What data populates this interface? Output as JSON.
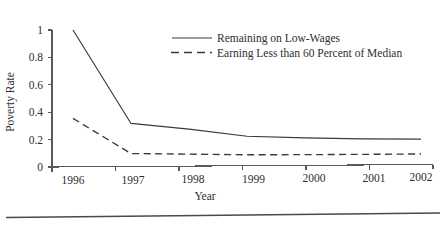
{
  "chart_data": {
    "type": "line",
    "title": "",
    "xlabel": "Year",
    "ylabel": "Poverty Rate",
    "x": [
      1996,
      1997,
      1998,
      1999,
      2000,
      2001,
      2002
    ],
    "xtick_labels": [
      "1996",
      "1997",
      "1998",
      "1999",
      "2000",
      "2001",
      "2002"
    ],
    "ytick_labels": [
      "0",
      "0.2",
      "0.4",
      "0.6",
      "0.8",
      "1"
    ],
    "yticks": [
      0,
      0.2,
      0.4,
      0.6,
      0.8,
      1
    ],
    "ylim": [
      0,
      1
    ],
    "xlim": [
      1996,
      2002
    ],
    "grid": false,
    "legend_position": "upper-center-right",
    "series": [
      {
        "name": "Remaining on Low-Wages",
        "style": "solid",
        "color": "#3a3a3a",
        "values": [
          1.0,
          0.315,
          0.27,
          0.215,
          0.2,
          0.19,
          0.185
        ]
      },
      {
        "name": "Earning Less than 60 Percent of Median",
        "style": "dashed",
        "color": "#3a3a3a",
        "values": [
          0.355,
          0.095,
          0.088,
          0.08,
          0.078,
          0.077,
          0.077
        ]
      }
    ]
  },
  "legend": {
    "items": [
      {
        "label": "Remaining on Low-Wages",
        "style": "solid"
      },
      {
        "label": "Earning Less than 60 Percent of Median",
        "style": "dashed"
      }
    ]
  },
  "axes": {
    "y_title": "Poverty Rate",
    "x_title": "Year"
  }
}
